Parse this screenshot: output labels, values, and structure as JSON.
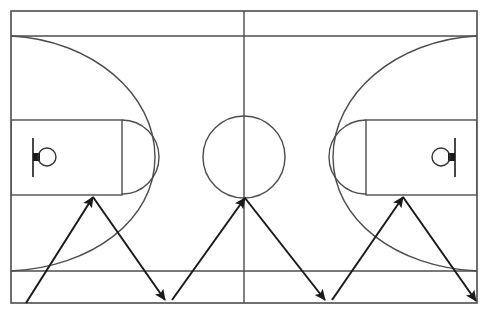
{
  "diagram": {
    "type": "sports-court-diagram",
    "background_color": "#ffffff",
    "line_color": "#4d4d4d",
    "arrow_color": "#1a1a1a",
    "hoop_color": "#333333",
    "backboard_color": "#1a1a1a",
    "court": {
      "name": "full-court",
      "left": 11,
      "top": 11,
      "right": 477,
      "bottom": 303,
      "width": 466,
      "height": 292,
      "line_width": 1.6
    },
    "center_line": {
      "name": "half-court-line",
      "x": 244,
      "y1": 11,
      "y2": 303
    },
    "center_circle": {
      "name": "center-circle",
      "cx": 244,
      "cy": 157,
      "r": 41
    },
    "baseline_endlines": [
      {
        "name": "top-three-point-baseline",
        "x1": 11,
        "y1": 36,
        "x2": 477,
        "y2": 36
      },
      {
        "name": "bottom-three-point-baseline",
        "x1": 11,
        "y1": 271,
        "x2": 477,
        "y2": 271
      }
    ],
    "halves": [
      {
        "name": "left-half",
        "side": "left",
        "key": {
          "name": "left-key",
          "x": 11,
          "y": 120,
          "width": 111,
          "height": 75
        },
        "free_throw_arc": {
          "name": "left-free-throw-circle",
          "cx": 122,
          "cy": 157,
          "r": 37
        },
        "three_point_arc": {
          "name": "left-three-point-arc",
          "start_x": 11,
          "start_y": 36,
          "end_x": 11,
          "end_y": 271,
          "apex_x": 155,
          "apex_y": 157
        },
        "backboard": {
          "name": "left-backboard",
          "x": 33,
          "y1": 138,
          "y2": 177
        },
        "hoop": {
          "name": "left-hoop",
          "cx": 47,
          "cy": 157,
          "r": 9
        },
        "hoop_connector": {
          "name": "left-hoop-connector",
          "x": 33,
          "y": 153,
          "width": 7,
          "height": 8
        }
      },
      {
        "name": "right-half",
        "side": "right",
        "key": {
          "name": "right-key",
          "x": 366,
          "y": 120,
          "width": 111,
          "height": 75
        },
        "free_throw_arc": {
          "name": "right-free-throw-circle",
          "cx": 366,
          "cy": 157,
          "r": 37
        },
        "three_point_arc": {
          "name": "right-three-point-arc",
          "start_x": 477,
          "start_y": 36,
          "end_x": 477,
          "end_y": 271,
          "apex_x": 333,
          "apex_y": 157
        },
        "backboard": {
          "name": "right-backboard",
          "x": 455,
          "y1": 138,
          "y2": 177
        },
        "hoop": {
          "name": "right-hoop",
          "cx": 441,
          "cy": 157,
          "r": 9
        },
        "hoop_connector": {
          "name": "right-hoop-connector",
          "x": 448,
          "y": 153,
          "width": 7,
          "height": 8
        }
      }
    ],
    "drill_path": {
      "name": "zigzag-dribble-path",
      "stroke_width": 2,
      "arrow_head_length": 11,
      "arrow_head_width": 9,
      "segments": [
        {
          "name": "segment-1",
          "from_x": 26,
          "from_y": 303,
          "to_x": 93,
          "to_y": 197
        },
        {
          "name": "segment-2",
          "from_x": 93,
          "from_y": 197,
          "to_x": 165,
          "to_y": 300
        },
        {
          "name": "segment-3",
          "from_x": 172,
          "from_y": 300,
          "to_x": 245,
          "to_y": 198
        },
        {
          "name": "segment-4",
          "from_x": 245,
          "from_y": 198,
          "to_x": 325,
          "to_y": 300
        },
        {
          "name": "segment-5",
          "from_x": 332,
          "from_y": 300,
          "to_x": 403,
          "to_y": 197
        },
        {
          "name": "segment-6",
          "from_x": 403,
          "from_y": 197,
          "to_x": 476,
          "to_y": 301
        }
      ]
    }
  }
}
